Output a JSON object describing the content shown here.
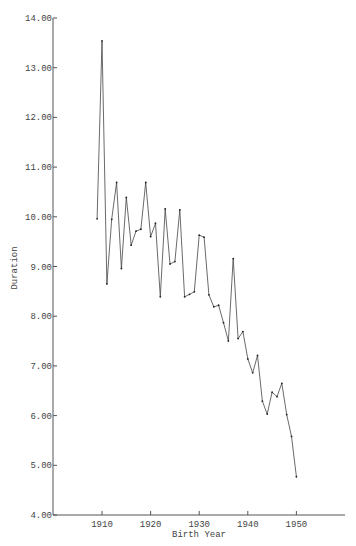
{
  "chart_data": {
    "type": "line",
    "title": "",
    "xlabel": "Birth Year",
    "ylabel": "Duration",
    "xlim": [
      1900,
      1962
    ],
    "ylim": [
      4.0,
      14.0
    ],
    "grid": false,
    "legend": null,
    "x_ticks": [
      1910,
      1920,
      1930,
      1940,
      1950
    ],
    "x_tick_labels": [
      "1910",
      "1920",
      "1930",
      "1940",
      "1950"
    ],
    "y_ticks": [
      4,
      5,
      6,
      7,
      8,
      9,
      10,
      11,
      12,
      13,
      14
    ],
    "y_tick_labels": [
      "4.00",
      "5.00",
      "6.00",
      "7.00",
      "8.00",
      "9.00",
      "10.00",
      "11.00",
      "12.00",
      "13.00",
      "14.00"
    ],
    "x": [
      1909,
      1910,
      1911,
      1912,
      1913,
      1914,
      1915,
      1916,
      1917,
      1918,
      1919,
      1920,
      1921,
      1922,
      1923,
      1924,
      1925,
      1926,
      1927,
      1928,
      1929,
      1930,
      1931,
      1932,
      1933,
      1934,
      1935,
      1936,
      1937,
      1938,
      1939,
      1940,
      1941,
      1942,
      1943,
      1944,
      1945,
      1946,
      1947,
      1948,
      1949,
      1950
    ],
    "series": [
      {
        "name": "Duration",
        "values": [
          9.96,
          13.54,
          8.65,
          9.95,
          10.69,
          8.96,
          10.39,
          9.43,
          9.71,
          9.75,
          10.69,
          9.6,
          9.87,
          8.39,
          10.16,
          9.05,
          9.1,
          10.14,
          8.39,
          8.44,
          8.49,
          9.63,
          9.59,
          8.43,
          8.19,
          8.22,
          7.87,
          7.5,
          9.16,
          7.55,
          7.69,
          7.14,
          6.86,
          7.21,
          6.29,
          6.03,
          6.47,
          6.38,
          6.65,
          6.02,
          5.58,
          4.77
        ]
      }
    ]
  }
}
